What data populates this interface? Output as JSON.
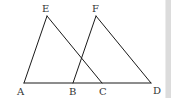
{
  "diagram": {
    "type": "geometry",
    "line_color": "#1a1a1a",
    "label_color": "#333333",
    "points": {
      "A": {
        "label": "A",
        "x": 24,
        "y": 83,
        "lx": 17,
        "ly": 95
      },
      "B": {
        "label": "B",
        "x": 73,
        "y": 83,
        "lx": 69,
        "ly": 95
      },
      "C": {
        "label": "C",
        "x": 102,
        "y": 83,
        "lx": 99,
        "ly": 95
      },
      "D": {
        "label": "D",
        "x": 151,
        "y": 83,
        "lx": 153,
        "ly": 94
      },
      "E": {
        "label": "E",
        "x": 47,
        "y": 16,
        "lx": 42,
        "ly": 12
      },
      "F": {
        "label": "F",
        "x": 96,
        "y": 16,
        "lx": 92,
        "ly": 12
      }
    },
    "segments": [
      [
        "A",
        "D"
      ],
      [
        "A",
        "E"
      ],
      [
        "E",
        "C"
      ],
      [
        "B",
        "F"
      ],
      [
        "F",
        "D"
      ]
    ],
    "triangles": [
      "AEC",
      "BFD"
    ]
  }
}
